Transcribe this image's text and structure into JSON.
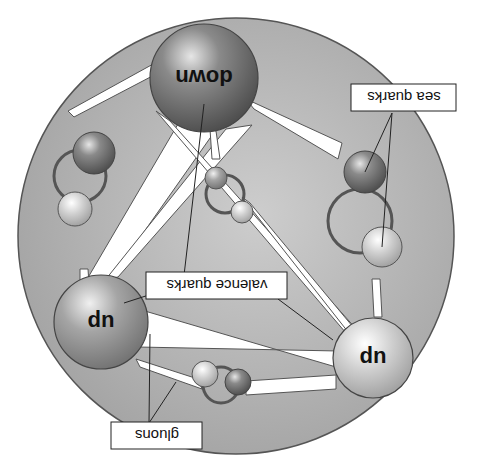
{
  "diagram": {
    "orientation": "rotated 180 degrees",
    "colors": {
      "background": "#ffffff",
      "proton_fill": "#a9a9a9",
      "proton_stroke": "#555555",
      "gluon_tube": "#ffffff",
      "loop_stroke": "#555555",
      "label_box_fill": "#ffffff",
      "label_box_stroke": "#222222"
    },
    "valence_quarks": [
      {
        "id": "down",
        "label": "down",
        "shade": "dark"
      },
      {
        "id": "up-left",
        "label": "up",
        "shade": "medium"
      },
      {
        "id": "up-right",
        "label": "up",
        "shade": "light"
      }
    ],
    "sea_quark_pairs": 4,
    "callouts": {
      "sea_quarks": "sea quarks",
      "valence_quarks": "valence quarks",
      "gluons": "gluons"
    }
  }
}
